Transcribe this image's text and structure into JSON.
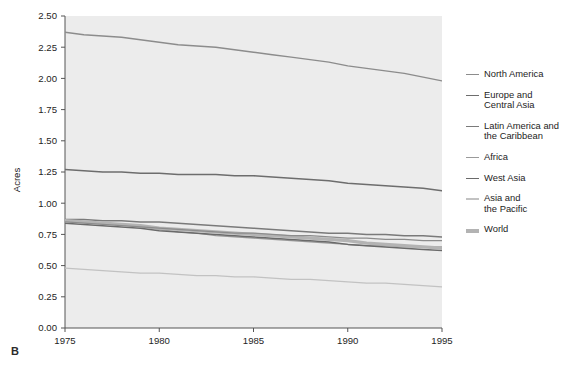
{
  "figure": {
    "panel_label": "B",
    "background_color": "#ffffff",
    "plot_background_color": "#ececec"
  },
  "legend": {
    "position": "right",
    "items": [
      {
        "label": "North America",
        "color": "#8c8c8c",
        "width": 1.4
      },
      {
        "label": "Europe and\nCentral Asia",
        "color": "#6d6d6d",
        "width": 1.6
      },
      {
        "label": "Latin America and\nthe Caribbean",
        "color": "#7a7a7a",
        "width": 1.5
      },
      {
        "label": "Africa",
        "color": "#9a9a9a",
        "width": 1.3
      },
      {
        "label": "West Asia",
        "color": "#6a6a6a",
        "width": 1.5
      },
      {
        "label": "Asia and\nthe Pacific",
        "color": "#c2c2c2",
        "width": 1.3
      },
      {
        "label": "World",
        "color": "#b3b3b3",
        "width": 3.4
      }
    ]
  },
  "chart_data": {
    "type": "line",
    "title": "",
    "xlabel": "",
    "ylabel": "Acres",
    "xlim": [
      1975,
      1995
    ],
    "ylim": [
      0.0,
      2.5
    ],
    "grid": false,
    "xticks": [
      1975,
      1980,
      1985,
      1990,
      1995
    ],
    "xtick_labels": [
      "1975",
      "1980",
      "1985",
      "1990",
      "1995"
    ],
    "yticks": [
      0.0,
      0.25,
      0.5,
      0.75,
      1.0,
      1.25,
      1.5,
      1.75,
      2.0,
      2.25,
      2.5
    ],
    "ytick_labels": [
      "0.00",
      "0.25",
      "0.50",
      "0.75",
      "1.00",
      "1.25",
      "1.50",
      "1.75",
      "2.00",
      "2.25",
      "2.50"
    ],
    "x": [
      1975,
      1976,
      1977,
      1978,
      1979,
      1980,
      1981,
      1982,
      1983,
      1984,
      1985,
      1986,
      1987,
      1988,
      1989,
      1990,
      1991,
      1992,
      1993,
      1994,
      1995
    ],
    "series": [
      {
        "name": "North America",
        "color": "#8c8c8c",
        "width": 1.4,
        "values": [
          2.37,
          2.35,
          2.34,
          2.33,
          2.31,
          2.29,
          2.27,
          2.26,
          2.25,
          2.23,
          2.21,
          2.19,
          2.17,
          2.15,
          2.13,
          2.1,
          2.08,
          2.06,
          2.04,
          2.01,
          1.98
        ]
      },
      {
        "name": "Europe and Central Asia",
        "color": "#6d6d6d",
        "width": 1.6,
        "values": [
          1.27,
          1.26,
          1.25,
          1.25,
          1.24,
          1.24,
          1.23,
          1.23,
          1.23,
          1.22,
          1.22,
          1.21,
          1.2,
          1.19,
          1.18,
          1.16,
          1.15,
          1.14,
          1.13,
          1.12,
          1.1
        ]
      },
      {
        "name": "Latin America and the Caribbean",
        "color": "#7a7a7a",
        "width": 1.5,
        "values": [
          0.87,
          0.87,
          0.86,
          0.86,
          0.85,
          0.85,
          0.84,
          0.83,
          0.82,
          0.81,
          0.8,
          0.79,
          0.78,
          0.77,
          0.76,
          0.76,
          0.75,
          0.75,
          0.74,
          0.74,
          0.73
        ]
      },
      {
        "name": "Africa",
        "color": "#9a9a9a",
        "width": 1.3,
        "values": [
          0.86,
          0.85,
          0.84,
          0.83,
          0.81,
          0.79,
          0.77,
          0.76,
          0.74,
          0.73,
          0.72,
          0.71,
          0.7,
          0.69,
          0.68,
          0.67,
          0.66,
          0.66,
          0.65,
          0.65,
          0.65
        ]
      },
      {
        "name": "West Asia",
        "color": "#6a6a6a",
        "width": 1.5,
        "values": [
          0.84,
          0.83,
          0.82,
          0.81,
          0.8,
          0.78,
          0.77,
          0.76,
          0.75,
          0.74,
          0.73,
          0.72,
          0.71,
          0.7,
          0.69,
          0.67,
          0.66,
          0.65,
          0.64,
          0.63,
          0.62
        ]
      },
      {
        "name": "Asia and the Pacific",
        "color": "#c2c2c2",
        "width": 1.3,
        "values": [
          0.48,
          0.47,
          0.46,
          0.45,
          0.44,
          0.44,
          0.43,
          0.42,
          0.42,
          0.41,
          0.41,
          0.4,
          0.39,
          0.39,
          0.38,
          0.37,
          0.36,
          0.36,
          0.35,
          0.34,
          0.33
        ]
      },
      {
        "name": "World",
        "color": "#b3b3b3",
        "width": 3.4,
        "values": [
          0.86,
          0.85,
          0.84,
          0.83,
          0.82,
          0.8,
          0.79,
          0.78,
          0.77,
          0.76,
          0.75,
          0.74,
          0.73,
          0.72,
          0.71,
          0.7,
          0.68,
          0.67,
          0.66,
          0.65,
          0.64
        ]
      },
      {
        "name": "North America lower trace",
        "color": "#8c8c8c",
        "width": 1.2,
        "values": [
          0.85,
          0.84,
          0.83,
          0.82,
          0.81,
          0.8,
          0.79,
          0.78,
          0.77,
          0.76,
          0.76,
          0.75,
          0.74,
          0.74,
          0.73,
          0.72,
          0.72,
          0.71,
          0.71,
          0.7,
          0.7
        ]
      }
    ]
  }
}
